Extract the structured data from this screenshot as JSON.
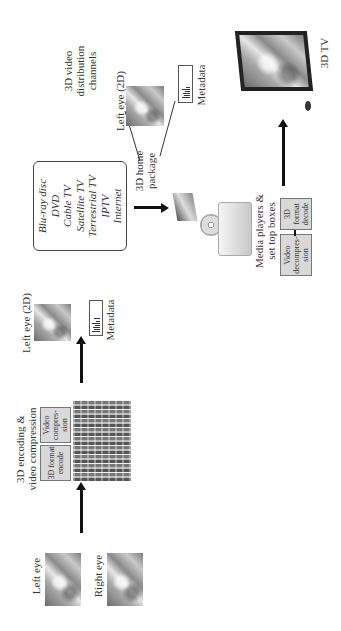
{
  "stage1": {
    "left_eye_label": "Left eye",
    "right_eye_label": "Right eye"
  },
  "stage2": {
    "title_line1": "3D encoding &",
    "title_line2": "video compression",
    "box1": "3D format encode",
    "box2": "Video compres-sion"
  },
  "stage3": {
    "left_eye_label": "Left eye (2D)",
    "metadata_label": "Metadata"
  },
  "channels": {
    "items": [
      "Blu-ray disc",
      "DVD",
      "Cable TV",
      "Satellite TV",
      "Terrestrial TV",
      "IPTV",
      "Internet"
    ],
    "caption_line1": "3D video",
    "caption_line2": "distribution",
    "caption_line3": "channels"
  },
  "package": {
    "label_line1": "3D home",
    "label_line2": "package",
    "left_eye_label": "Left eye (2D)",
    "metadata_label": "Metadata"
  },
  "players": {
    "label_line1": "Media players &",
    "label_line2": "set top boxes",
    "box1": "Video decompres-sion",
    "box2": "3D format decode"
  },
  "tv": {
    "label": "3D TV"
  }
}
